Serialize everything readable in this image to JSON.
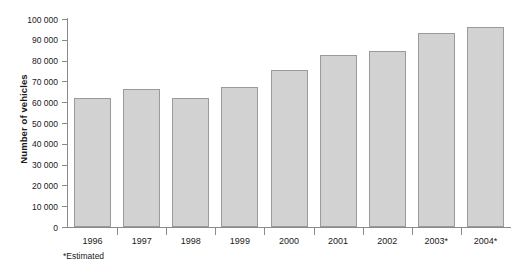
{
  "chart_data": {
    "type": "bar",
    "title": "",
    "xlabel": "",
    "ylabel": "Number of vehicles",
    "categories": [
      "1996",
      "1997",
      "1998",
      "1999",
      "2000",
      "2001",
      "2002",
      "2003*",
      "2004*"
    ],
    "values": [
      62000,
      66500,
      62000,
      67500,
      75500,
      82500,
      84500,
      93500,
      96000
    ],
    "ylim": [
      0,
      100000
    ],
    "ytick_step": 10000,
    "ytick_labels": [
      "100 000",
      "90 000",
      "80 000",
      "70 000",
      "60 000",
      "50 000",
      "40 000",
      "30 000",
      "20 000",
      "10 000",
      "0"
    ],
    "ytick_values": [
      100000,
      90000,
      80000,
      70000,
      60000,
      50000,
      40000,
      30000,
      20000,
      10000,
      0
    ],
    "grid": false,
    "legend": null,
    "footnote": "*Estimated",
    "colors": {
      "bar_fill": "#d2d2d2",
      "bar_border": "#9a9a9a",
      "axis": "#8a8a8a",
      "text": "#1a1a1a",
      "background": "#ffffff"
    }
  }
}
